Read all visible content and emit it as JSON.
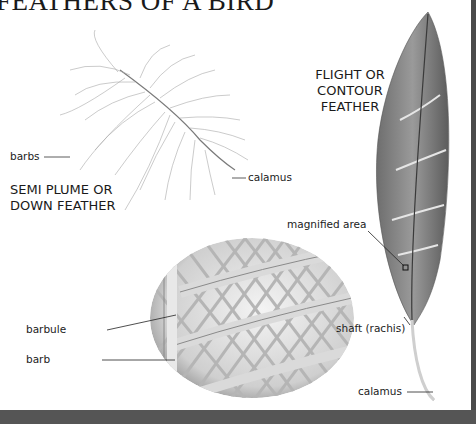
{
  "title": "FEATHERS OF A BIRD",
  "down_feather": {
    "heading_line1": "SEMI PLUME OR",
    "heading_line2": "DOWN FEATHER",
    "labels": {
      "barbs": "barbs",
      "calamus": "calamus"
    }
  },
  "flight_feather": {
    "heading_line1": "FLIGHT OR",
    "heading_line2": "CONTOUR",
    "heading_line3": "FEATHER",
    "labels": {
      "magnified_area": "magnified area",
      "shaft": "shaft (rachis)",
      "calamus": "calamus"
    }
  },
  "magnified_view": {
    "labels": {
      "barbule": "barbule",
      "barb": "barb"
    }
  },
  "colors": {
    "frame": "#4a4a4a",
    "ink": "#222222",
    "feather": "#8a8a8a"
  }
}
